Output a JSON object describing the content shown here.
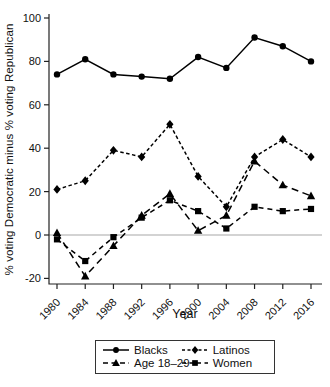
{
  "chart_data": {
    "type": "line",
    "title": "",
    "xlabel": "Year",
    "ylabel": "% voting Democratic minus % voting Republican",
    "x": [
      1980,
      1984,
      1988,
      1992,
      1996,
      2000,
      2004,
      2008,
      2012,
      2016
    ],
    "xticks": [
      1980,
      1984,
      1988,
      1992,
      1996,
      2000,
      2004,
      2008,
      2012,
      2016
    ],
    "yticks": [
      -20,
      0,
      20,
      40,
      60,
      80,
      100
    ],
    "ylim": [
      -24,
      103
    ],
    "grid": false,
    "zero_line": true,
    "legend_position": "bottom",
    "colors": {
      "data": "#000000",
      "axis": "#222222",
      "zero_line": "#c4c4c4"
    },
    "series": [
      {
        "name": "Blacks",
        "marker": "circle",
        "line_style": "solid",
        "values": [
          74,
          81,
          74,
          73,
          72,
          82,
          77,
          91,
          87,
          80
        ]
      },
      {
        "name": "Latinos",
        "marker": "diamond",
        "line_style": "dashed",
        "values": [
          21,
          25,
          39,
          36,
          51,
          27,
          13,
          36,
          44,
          36
        ]
      },
      {
        "name": "Age 18–29",
        "marker": "triangle",
        "line_style": "long-dash",
        "values": [
          1,
          -19,
          -5,
          9,
          19,
          2,
          9,
          34,
          23,
          18
        ]
      },
      {
        "name": "Women",
        "marker": "square",
        "line_style": "dash",
        "values": [
          -2,
          -12,
          -1,
          8,
          16,
          11,
          3,
          13,
          11,
          12
        ]
      }
    ]
  }
}
